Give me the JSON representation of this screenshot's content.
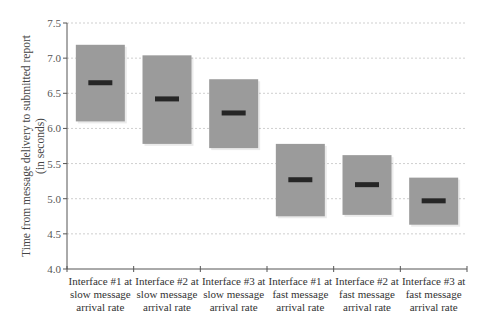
{
  "chart_data": {
    "type": "box",
    "title": "",
    "xlabel": "",
    "ylabel": "Time from message delivery to submitted report (in seconds)",
    "ylabel_lines": [
      "Time from message delivery to submitted report",
      "(in seconds)"
    ],
    "ylim": [
      4.0,
      7.5
    ],
    "yticks": [
      "4.0",
      "4.5",
      "5.0",
      "5.5",
      "6.0",
      "6.5",
      "7.0",
      "7.5"
    ],
    "grid": true,
    "legend": null,
    "categories": [
      "Interface #1 at slow message arrival rate",
      "Interface #2 at slow message arrival rate",
      "Interface #3 at slow message arrival rate",
      "Interface #1 at fast message arrival rate",
      "Interface #2 at fast message arrival rate",
      "Interface #3 at fast message arrival rate"
    ],
    "category_lines": [
      [
        "Interface #1 at",
        "slow message",
        "arrival rate"
      ],
      [
        "Interface #2 at",
        "slow message",
        "arrival rate"
      ],
      [
        "Interface #3 at",
        "slow message",
        "arrival rate"
      ],
      [
        "Interface #1 at",
        "fast message",
        "arrival rate"
      ],
      [
        "Interface #2 at",
        "fast message",
        "arrival rate"
      ],
      [
        "Interface #3 at",
        "fast message",
        "arrival rate"
      ]
    ],
    "series": [
      {
        "name": "upper",
        "values": [
          7.19,
          7.04,
          6.7,
          5.78,
          5.62,
          5.3
        ]
      },
      {
        "name": "median",
        "values": [
          6.65,
          6.42,
          6.22,
          5.27,
          5.2,
          4.97
        ]
      },
      {
        "name": "lower",
        "values": [
          6.1,
          5.78,
          5.72,
          4.75,
          4.77,
          4.63
        ]
      }
    ],
    "colors": {
      "box": "#9b9b9b",
      "median": "#262626",
      "axis": "#555555",
      "grid": "#cfcfcf"
    }
  }
}
